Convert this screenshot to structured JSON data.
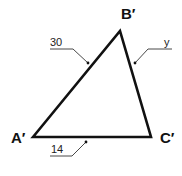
{
  "diagram": {
    "type": "triangle",
    "vertices": [
      {
        "id": "A",
        "label": "A′"
      },
      {
        "id": "B",
        "label": "B′"
      },
      {
        "id": "C",
        "label": "C′"
      }
    ],
    "sides": {
      "AB": {
        "label": "30"
      },
      "BC": {
        "label": "y"
      },
      "AC": {
        "label": "14"
      }
    },
    "colors": {
      "stroke": "#111111",
      "leader": "#333333"
    }
  }
}
